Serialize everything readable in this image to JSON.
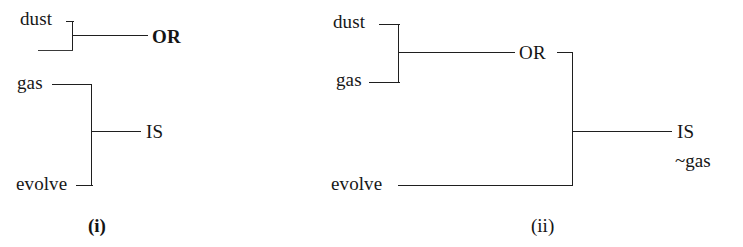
{
  "figure": {
    "background_color": "#ffffff",
    "ink_color": "#1f1f1f",
    "panels": [
      {
        "id": "panel-i",
        "caption": "(i)",
        "inputs": [
          {
            "name": "dust",
            "label": "dust"
          },
          {
            "name": "gas",
            "label": "gas"
          },
          {
            "name": "evolve",
            "label": "evolve"
          }
        ],
        "gates": [
          {
            "name": "or-gate",
            "label": "OR"
          },
          {
            "name": "is-gate",
            "label": "IS"
          }
        ]
      },
      {
        "id": "panel-ii",
        "caption": "(ii)",
        "inputs": [
          {
            "name": "dust",
            "label": "dust"
          },
          {
            "name": "gas",
            "label": "gas"
          },
          {
            "name": "evolve",
            "label": "evolve"
          }
        ],
        "gates": [
          {
            "name": "or-gate",
            "label": "OR"
          },
          {
            "name": "is-gate",
            "label": "IS"
          }
        ],
        "annotations": [
          {
            "name": "negated-gas",
            "label": "~gas"
          }
        ]
      }
    ]
  },
  "panel_i": {
    "label_dust": "dust",
    "label_gas": "gas",
    "label_evolve": "evolve",
    "label_or": "OR",
    "label_is": "IS",
    "caption": "(i)"
  },
  "panel_ii": {
    "label_dust": "dust",
    "label_gas": "gas",
    "label_evolve": "evolve",
    "label_or": "OR",
    "label_is": "IS",
    "label_not_gas": "~gas",
    "caption": "(ii)"
  }
}
